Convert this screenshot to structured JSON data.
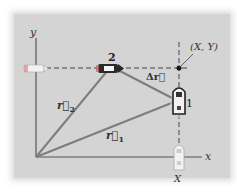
{
  "diagram": {
    "axes": {
      "x_label": "x",
      "y_label": "y"
    },
    "points": {
      "p1": {
        "label": "1"
      },
      "p2": {
        "label": "2"
      },
      "intersection": {
        "label": "(X, Y)"
      },
      "x_mark": {
        "label": "X"
      }
    },
    "vectors": {
      "r1": {
        "label": "r⃗",
        "subscript": "1"
      },
      "r2": {
        "label": "r⃗",
        "subscript": "2"
      },
      "dr": {
        "label": "Δr⃗"
      }
    },
    "colors": {
      "background": "#d4d4d4",
      "vector": "#7d7d7d",
      "axis": "#555555",
      "dashed": "#444444"
    }
  }
}
